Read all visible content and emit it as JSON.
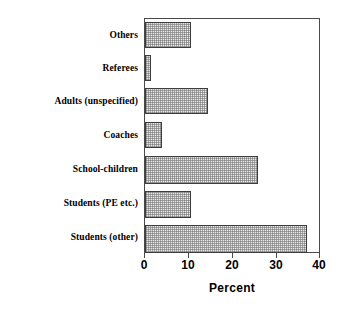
{
  "chart_data": {
    "type": "bar",
    "orientation": "horizontal",
    "title": "",
    "xlabel": "Percent",
    "ylabel": "",
    "xlim": [
      0,
      40
    ],
    "xticks": [
      0,
      10,
      20,
      30,
      40
    ],
    "xtick_labels": [
      "0",
      "10",
      "20",
      "30",
      "40"
    ],
    "grid": false,
    "legend": null,
    "categories": [
      "Others",
      "Referees",
      "Adults (unspecified)",
      "Coaches",
      "School-children",
      "Students (PE etc.)",
      "Students (other)"
    ],
    "values": [
      10.5,
      1.3,
      14.5,
      4.0,
      26.0,
      10.5,
      37.3
    ],
    "series": [
      {
        "name": "Percent",
        "values": [
          10.5,
          1.3,
          14.5,
          4.0,
          26.0,
          10.5,
          37.3
        ]
      }
    ],
    "colors": {
      "bar_fill": "#e8e8e8",
      "bar_edge": "#3d3d3d",
      "axis": "#4a4a4a",
      "text": "#000000",
      "background": "#ffffff"
    }
  }
}
